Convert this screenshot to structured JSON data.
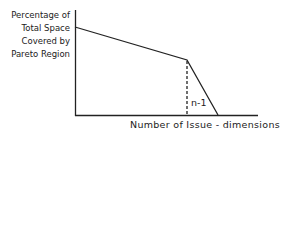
{
  "diagram": {
    "y_axis_label_lines": [
      "Percentage of",
      "Total Space",
      "Covered by",
      "Pareto Region"
    ],
    "x_axis_label": "Number of Issue - dimensions",
    "marker_label": "n-1",
    "curve_points": [
      [
        75,
        27
      ],
      [
        187,
        60
      ],
      [
        218,
        115
      ]
    ],
    "line_color": "#222222"
  }
}
